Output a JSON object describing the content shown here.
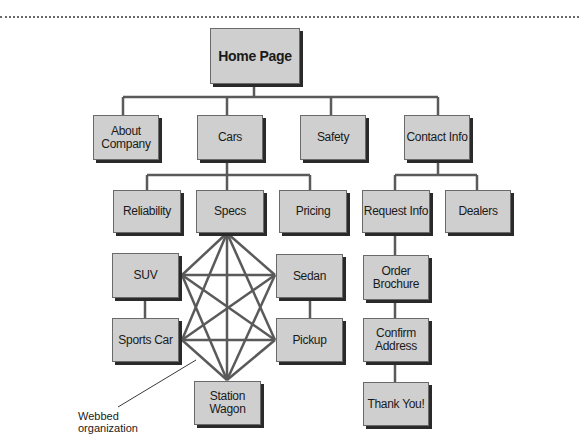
{
  "diagram": {
    "colors": {
      "node_fill": "#cfcfcf",
      "node_border": "#6a6a6a",
      "shadow": "#2a2a2a",
      "line": "#5a5a5a"
    },
    "nodes": {
      "home": "Home Page",
      "about": "About\nCompany",
      "cars": "Cars",
      "safety": "Safety",
      "contact": "Contact Info",
      "reliability": "Reliability",
      "specs": "Specs",
      "pricing": "Pricing",
      "request": "Request Info",
      "dealers": "Dealers",
      "suv": "SUV",
      "sedan": "Sedan",
      "sports": "Sports Car",
      "pickup": "Pickup",
      "wagon": "Station\nWagon",
      "order": "Order\nBrochure",
      "confirm": "Confirm\nAddress",
      "thanks": "Thank You!"
    },
    "annotation": "Webbed\norganization"
  }
}
